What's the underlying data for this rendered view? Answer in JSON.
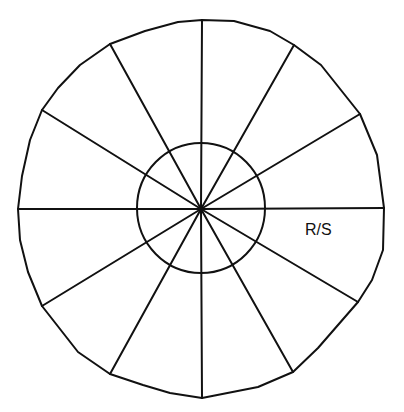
{
  "diagram": {
    "type": "segmented-wheel",
    "center": [
      201,
      209
    ],
    "outer_outline": "M202,20 L234,21 L270,31 L294,45 L321,65 L360,114 L377,155 L384,208 L383,250 L372,280 L358,302 L318,348 L293,372 L258,387 L202,398 L170,393 L143,385 L110,374 L78,352 L42,306 L28,272 L20,240 L18,209 L22,176 L30,140 L42,110 L58,88 L80,65 L110,44 L145,31 L178,22 Z",
    "inner_circle": {
      "cx": 201,
      "cy": 208,
      "rx": 64,
      "ry": 65
    },
    "spokes": [
      {
        "x": 202,
        "y": 20
      },
      {
        "x": 294,
        "y": 45
      },
      {
        "x": 360,
        "y": 114
      },
      {
        "x": 384,
        "y": 208
      },
      {
        "x": 358,
        "y": 302
      },
      {
        "x": 293,
        "y": 372
      },
      {
        "x": 202,
        "y": 398
      },
      {
        "x": 110,
        "y": 374
      },
      {
        "x": 42,
        "y": 306
      },
      {
        "x": 18,
        "y": 209
      },
      {
        "x": 42,
        "y": 110
      },
      {
        "x": 110,
        "y": 44
      }
    ],
    "segment_count": 12,
    "labels": [
      {
        "text": "R/S",
        "x": 305,
        "y": 222
      }
    ],
    "stroke_color": "#111111",
    "background": "#ffffff"
  }
}
